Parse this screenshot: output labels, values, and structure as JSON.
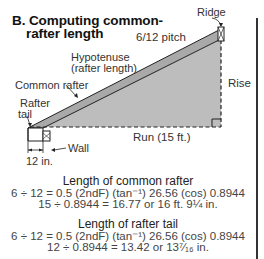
{
  "figure": {
    "title_line1": "B. Computing common-",
    "title_line2": "rafter length"
  },
  "labels": {
    "ridge": "Ridge",
    "pitch": "6/12 pitch",
    "hypotenuse_line1": "Hypotenuse",
    "hypotenuse_line2": "(rafter length)",
    "common_rafter": "Common rafter",
    "rafter_tail_line1": "Rafter",
    "rafter_tail_line2": "tail",
    "rise": "Rise",
    "run": "Run (15 ft.)",
    "wall": "Wall",
    "tail_dimension": "12 in."
  },
  "calculations": [
    {
      "heading": "Length of common rafter",
      "line1": "6 ÷ 12 = 0.5 (2ndF) (tan⁻¹) 26.56 (cos) 0.8944",
      "line2": "15 ÷ 0.8944 = 16.77 or 16 ft. 9¼ in."
    },
    {
      "heading": "Length of rafter tail",
      "line1": "6 ÷ 12 = 0.5 (2ndF) (tan⁻¹) 26.56 (cos) 0.8944",
      "line2": "12 ÷ 0.8944 = 13.42 or 13⁷⁄₁₆ in."
    }
  ],
  "colors": {
    "fill_gray": "#b8b8b8",
    "line": "#222222"
  }
}
